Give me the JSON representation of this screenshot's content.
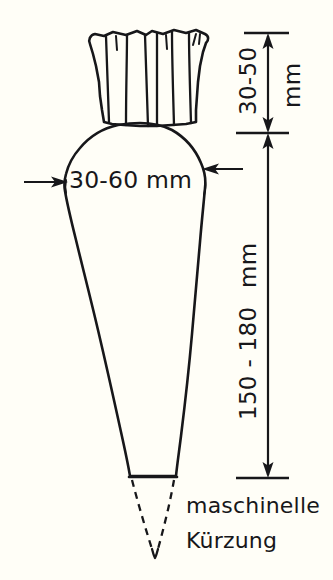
{
  "figure": {
    "background_color": "#fffef7",
    "ink_color": "#17171a"
  },
  "dimensions": {
    "crown_height": {
      "value": "30-50",
      "unit": "mm",
      "full": "30-50 mm",
      "orientation": "vertical",
      "description": "Höhe des Blattansatzes / Kopfes"
    },
    "body_length": {
      "value": "150 - 180",
      "unit": "mm",
      "full": "150 - 180 mm",
      "orientation": "vertical",
      "description": "Länge des Rübenkörpers"
    },
    "shoulder_width": {
      "value": "30-60",
      "unit": "mm",
      "full": "30-60 mm",
      "orientation": "horizontal",
      "description": "Breite an der breitesten Stelle"
    }
  },
  "annotations": {
    "tip_note_line1": "maschinelle",
    "tip_note_line2": "Kürzung"
  }
}
